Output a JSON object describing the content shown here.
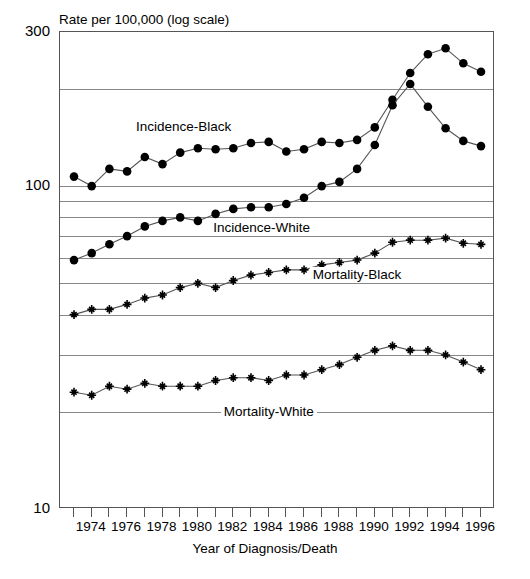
{
  "chart_data": {
    "type": "line",
    "title": "",
    "ylabel": "Rate per 100,000 (log scale)",
    "xlabel": "Year of Diagnosis/Death",
    "yscale": "log",
    "ylim": [
      10,
      300
    ],
    "ytick_labels": [
      "300",
      "100",
      "10"
    ],
    "ytick_values": [
      300,
      100,
      10
    ],
    "gridline_values": [
      200,
      100,
      90,
      80,
      70,
      60,
      50,
      40,
      30,
      20
    ],
    "grid": true,
    "legend_position": "inline-annotations",
    "x": [
      1973,
      1974,
      1975,
      1976,
      1977,
      1978,
      1979,
      1980,
      1981,
      1982,
      1983,
      1984,
      1985,
      1986,
      1987,
      1988,
      1989,
      1990,
      1991,
      1992,
      1993,
      1994,
      1995,
      1996
    ],
    "xtick_labels": [
      "1974",
      "1976",
      "1978",
      "1980",
      "1982",
      "1984",
      "1986",
      "1988",
      "1990",
      "1992",
      "1994",
      "1996"
    ],
    "xtick_values": [
      1974,
      1976,
      1978,
      1980,
      1982,
      1984,
      1986,
      1988,
      1990,
      1992,
      1994,
      1996
    ],
    "series": [
      {
        "name": "Incidence-Black",
        "marker": "filled-circle",
        "label_x": 1979.2,
        "label_y": 152,
        "values": [
          107,
          100,
          113,
          111,
          123,
          117,
          127,
          131,
          130,
          131,
          136,
          137,
          128,
          130,
          137,
          136,
          139,
          152,
          185,
          224,
          256,
          267,
          240,
          226
        ]
      },
      {
        "name": "Incidence-White",
        "marker": "filled-circle",
        "label_x": 1983.6,
        "label_y": 74,
        "values": [
          59,
          62,
          66,
          70,
          75,
          78,
          80,
          78,
          82,
          85,
          86,
          86,
          88,
          92,
          100,
          103,
          113,
          134,
          178,
          207,
          176,
          151,
          138,
          133
        ]
      },
      {
        "name": "Mortality-Black",
        "marker": "plus",
        "label_x": 1989.0,
        "label_y": 53,
        "values": [
          40,
          41.5,
          41.5,
          43,
          45,
          46,
          48.5,
          50,
          48.5,
          51,
          53,
          54,
          55,
          55,
          57,
          58,
          59,
          62,
          67,
          68,
          68,
          69,
          66.5,
          66
        ]
      },
      {
        "name": "Mortality-White",
        "marker": "plus",
        "label_x": 1984.0,
        "label_y": 20,
        "values": [
          23,
          22.5,
          24,
          23.5,
          24.5,
          24,
          24,
          24,
          25,
          25.5,
          25.5,
          25,
          26,
          26,
          27,
          28,
          29.5,
          31,
          32,
          31,
          31,
          30,
          28.5,
          27
        ]
      }
    ]
  }
}
